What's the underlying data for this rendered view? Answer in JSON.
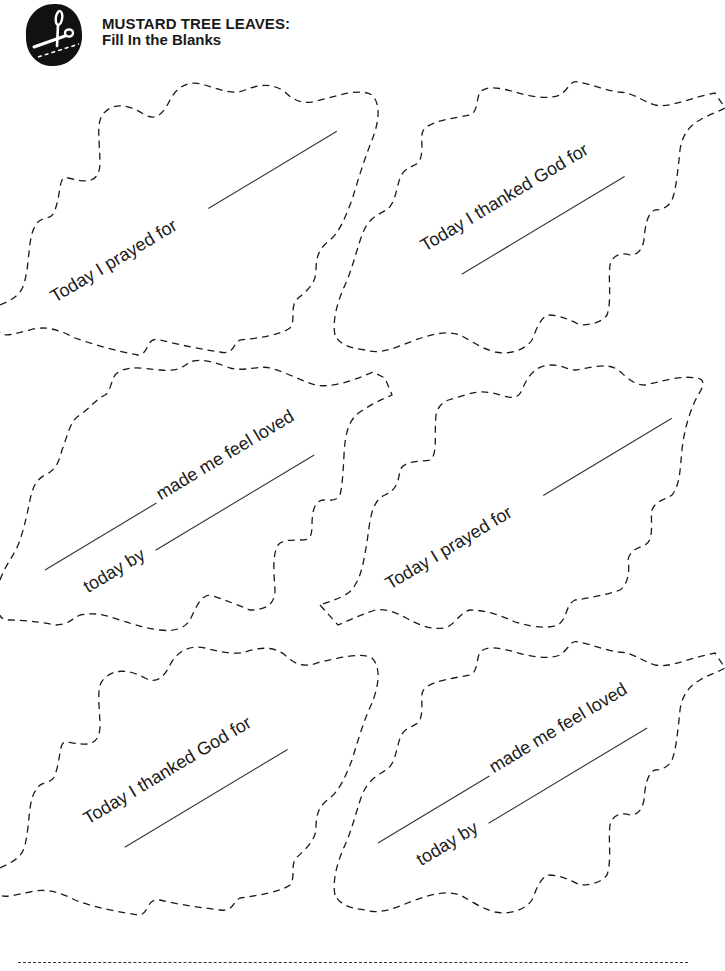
{
  "header": {
    "title_line1": "MUSTARD TREE LEAVES:",
    "title_line2": "Fill In the Blanks",
    "logo_icon": "scissors-cut-icon"
  },
  "leaves": [
    {
      "position": "top-left",
      "prompt": "Today I prayed for",
      "blanks": 1
    },
    {
      "position": "top-right",
      "prompt": "Today I thanked God for",
      "blanks": 1
    },
    {
      "position": "middle-left",
      "prompt_part1": "made me feel loved",
      "prompt_part2": "today by",
      "blanks": 2
    },
    {
      "position": "middle-right",
      "prompt": "Today I prayed for",
      "blanks": 1
    },
    {
      "position": "bottom-left",
      "prompt": "Today I thanked God for",
      "blanks": 1
    },
    {
      "position": "bottom-right",
      "prompt_part1": "made me feel loved",
      "prompt_part2": "today by",
      "blanks": 2
    }
  ],
  "colors": {
    "ink": "#1a1a1a",
    "background": "#ffffff"
  }
}
